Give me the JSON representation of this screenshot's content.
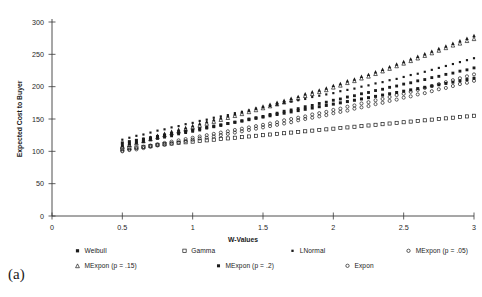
{
  "panel": {
    "label": "(a)"
  },
  "chart_data": {
    "type": "scatter",
    "title": "",
    "xlabel": "W-Values",
    "ylabel": "Expected Cost to Buyer",
    "xlim": [
      0,
      3
    ],
    "ylim": [
      0,
      300
    ],
    "xticks": [
      0,
      0.5,
      1,
      1.5,
      2,
      2.5,
      3
    ],
    "xtick_labels": [
      "0",
      "0.5",
      "1",
      "1.5",
      "2",
      "2.5",
      "3"
    ],
    "yticks": [
      0,
      50,
      100,
      150,
      200,
      250,
      300
    ],
    "ytick_labels": [
      "0",
      "50",
      "100",
      "150",
      "200",
      "250",
      "300"
    ],
    "grid": false,
    "legend_position": "bottom",
    "x": [
      0.5,
      0.55,
      0.6,
      0.65,
      0.7,
      0.75,
      0.8,
      0.85,
      0.9,
      0.95,
      1.0,
      1.05,
      1.1,
      1.15,
      1.2,
      1.25,
      1.3,
      1.35,
      1.4,
      1.45,
      1.5,
      1.55,
      1.6,
      1.65,
      1.7,
      1.75,
      1.8,
      1.85,
      1.9,
      1.95,
      2.0,
      2.05,
      2.1,
      2.15,
      2.2,
      2.25,
      2.3,
      2.35,
      2.4,
      2.45,
      2.5,
      2.55,
      2.6,
      2.65,
      2.7,
      2.75,
      2.8,
      2.85,
      2.9,
      2.95,
      3.0
    ],
    "series": [
      {
        "name": "Weibull",
        "marker": "filled-square",
        "values": [
          113,
          115,
          117,
          119,
          121,
          123,
          125,
          127,
          129,
          131,
          133,
          135,
          137,
          139,
          141,
          143,
          145,
          147,
          149,
          151,
          153,
          155,
          157,
          159,
          161,
          163,
          165,
          167,
          169,
          171,
          173,
          175,
          177,
          179,
          181,
          183,
          185,
          187,
          189,
          191,
          193,
          195,
          197,
          199,
          201,
          203,
          205,
          207,
          209,
          211,
          213
        ]
      },
      {
        "name": "Gamma",
        "marker": "open-square",
        "values": [
          104,
          105,
          106,
          107,
          108,
          110,
          111,
          112,
          113,
          114,
          115,
          116,
          117,
          118,
          119,
          120,
          121,
          122,
          123,
          124,
          125,
          126,
          127,
          128,
          129,
          130,
          131,
          132,
          133,
          134,
          135,
          136,
          137,
          138,
          139,
          140,
          141,
          142,
          143,
          144,
          145,
          146,
          147,
          148,
          149,
          150,
          151,
          152,
          153,
          154,
          155
        ]
      },
      {
        "name": "LNormal",
        "marker": "small-filled-square",
        "values": [
          118,
          121,
          124,
          126,
          129,
          132,
          134,
          137,
          139,
          142,
          144,
          147,
          149,
          152,
          154,
          156,
          159,
          161,
          163,
          166,
          168,
          170,
          172,
          175,
          177,
          179,
          181,
          184,
          186,
          188,
          190,
          193,
          195,
          197,
          200,
          202,
          205,
          207,
          210,
          212,
          215,
          218,
          220,
          223,
          226,
          229,
          232,
          235,
          238,
          241,
          244
        ]
      },
      {
        "name": "MExpon (p = .05)",
        "marker": "open-circle",
        "values": [
          101,
          103,
          105,
          107,
          109,
          111,
          113,
          115,
          117,
          119,
          121,
          123,
          125,
          127,
          129,
          131,
          133,
          135,
          137,
          139,
          141,
          143,
          145,
          148,
          150,
          152,
          154,
          157,
          159,
          161,
          164,
          166,
          169,
          171,
          174,
          176,
          179,
          181,
          184,
          187,
          189,
          192,
          195,
          198,
          201,
          204,
          207,
          210,
          213,
          216,
          219
        ]
      },
      {
        "name": "MExpon (p = .1)",
        "marker": "filled-triangle",
        "values": [
          110,
          113,
          116,
          119,
          122,
          125,
          128,
          131,
          134,
          137,
          140,
          143,
          146,
          149,
          152,
          155,
          158,
          161,
          164,
          167,
          170,
          173,
          176,
          179,
          182,
          185,
          189,
          192,
          195,
          198,
          202,
          205,
          209,
          212,
          216,
          219,
          223,
          227,
          231,
          235,
          239,
          243,
          247,
          251,
          255,
          259,
          263,
          267,
          271,
          275,
          279
        ]
      },
      {
        "name": "MExpon (p = .15)",
        "marker": "open-triangle",
        "values": [
          107,
          110,
          113,
          116,
          119,
          122,
          125,
          128,
          131,
          134,
          137,
          140,
          143,
          146,
          149,
          152,
          155,
          158,
          161,
          164,
          167,
          170,
          173,
          176,
          179,
          182,
          186,
          189,
          192,
          195,
          199,
          202,
          206,
          209,
          213,
          216,
          220,
          224,
          228,
          232,
          236,
          240,
          244,
          248,
          252,
          256,
          260,
          264,
          267,
          271,
          274
        ]
      },
      {
        "name": "MExpon (p = .2)",
        "marker": "filled-square-b",
        "values": [
          109,
          111,
          113,
          115,
          118,
          120,
          122,
          124,
          127,
          129,
          131,
          133,
          136,
          138,
          140,
          143,
          145,
          147,
          150,
          152,
          154,
          157,
          159,
          162,
          164,
          166,
          169,
          171,
          174,
          176,
          179,
          181,
          184,
          186,
          189,
          191,
          194,
          196,
          199,
          201,
          204,
          206,
          209,
          211,
          214,
          216,
          219,
          221,
          224,
          226,
          229
        ]
      },
      {
        "name": "Expon",
        "marker": "open-circle-b",
        "values": [
          100,
          102,
          103,
          105,
          107,
          109,
          110,
          112,
          114,
          116,
          118,
          120,
          121,
          123,
          125,
          127,
          129,
          131,
          133,
          135,
          137,
          139,
          141,
          143,
          145,
          148,
          150,
          152,
          154,
          156,
          159,
          161,
          163,
          166,
          168,
          170,
          173,
          175,
          178,
          180,
          183,
          185,
          188,
          190,
          193,
          196,
          198,
          201,
          204,
          206,
          209
        ]
      }
    ]
  },
  "legend": {
    "rows": [
      [
        {
          "label": "Weibull",
          "marker": "filled-square"
        },
        {
          "label": "Gamma",
          "marker": "open-square"
        },
        {
          "label": "LNormal",
          "marker": "small-filled-square"
        },
        {
          "label": "MExpon (p = .05)",
          "marker": "open-circle"
        },
        {
          "label": "MExpon (p = .1)",
          "marker": "filled-triangle"
        }
      ],
      [
        {
          "label": "MExpon (p = .15)",
          "marker": "open-triangle"
        },
        {
          "label": "MExpon (p = .2)",
          "marker": "filled-square-b"
        },
        {
          "label": "Expon",
          "marker": "open-circle-b"
        }
      ]
    ]
  }
}
